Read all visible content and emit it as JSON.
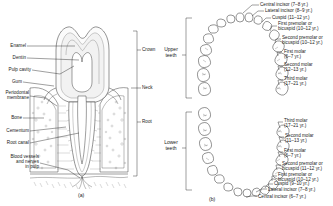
{
  "figure": {
    "panel_a": {
      "letter": "(a)",
      "left_labels": [
        "Enamel",
        "Dentin",
        "Pulp cavity",
        "Gum",
        "Periodontal\nmembrane",
        "Bone",
        "Cementum",
        "Root canal",
        "Blood vessels\nand nerves\nin pulp"
      ],
      "right_labels": [
        "Crown",
        "Neck",
        "Root"
      ]
    },
    "panel_b": {
      "letter": "(b)",
      "arch_labels": [
        "Upper\nteeth",
        "Lower\nteeth"
      ],
      "upper_teeth": [
        "Central incisor (7–8 yr.)",
        "Lateral incisor (8–9 yr.)",
        "Cuspid (11–12 yr.)",
        "First premolar or\nbicuspid (10–12 yr.)",
        "Second premolar or\nbicuspid (10–12 yr.)",
        "First molar\n(6–7 yr.)",
        "Second molar\n(12–13 yr.)",
        "Third molar\n(17–21 yr.)"
      ],
      "lower_teeth": [
        "Third molar\n(17–21 yr.)",
        "Second molar\n(11–13 yr.)",
        "First molar\n(6–7 yr.)",
        "Second premolar or\nbicuspid (11–12 yr.)",
        "First premolar or\nbicuspid (10–12 yr.)",
        "Cuspid (9–10 yr.)",
        "Lateral incisor (7–8 yr.)",
        "Central incisor (6–7 yr.)"
      ]
    },
    "colors": {
      "ink": "#2b2b2b",
      "background": "#ffffff"
    }
  }
}
